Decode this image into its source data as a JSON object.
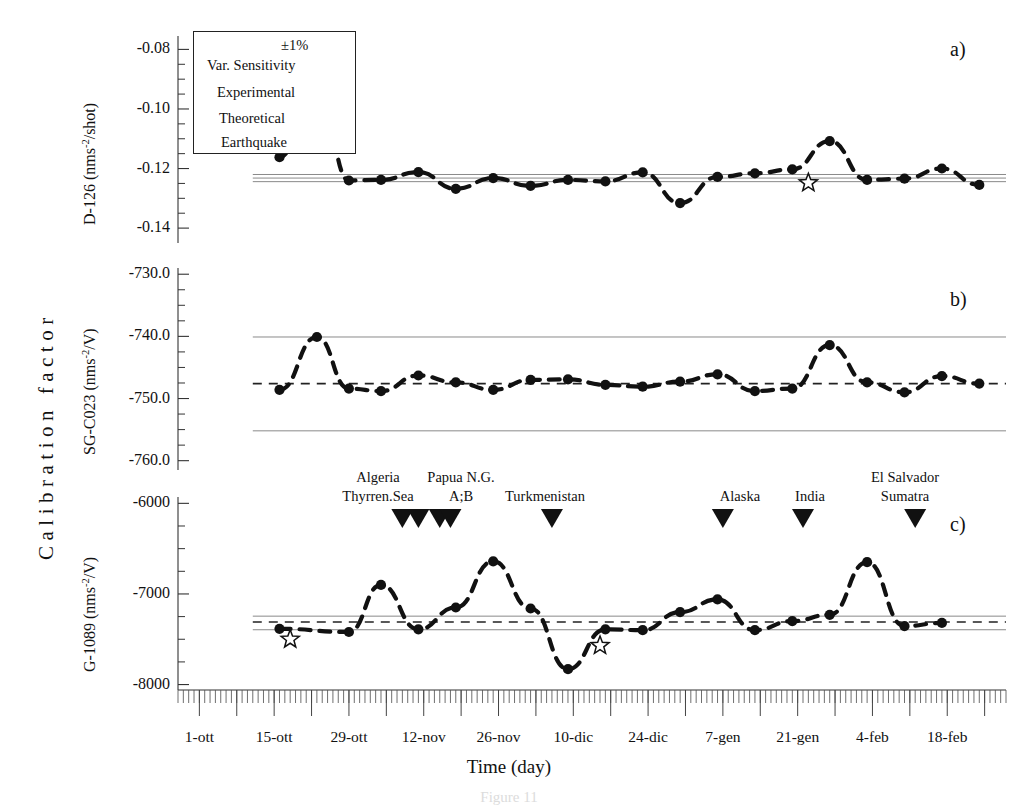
{
  "figure": {
    "caption": "Figure 11",
    "axis_y_group_label": "Calibration factor",
    "axis_x_label": "Time (day)"
  },
  "legend": {
    "dashed_label": "±1%",
    "sensitivity_label": "Var. Sensitivity",
    "experimental_label": "Experimental",
    "theoretical_label": "Theoretical",
    "earthquake_label": "Earthquake",
    "experimental_glyph": "star-open-icon",
    "theoretical_glyph": "filled-circle-icon",
    "earthquake_glyph": "down-triangle-icon"
  },
  "panels": [
    {
      "letter": "a)",
      "ylabel_text": "D-126 (nms",
      "ylabel_sup": "-2",
      "ylabel_tail": "/shot)",
      "yticks": [
        "-0.08",
        "-0.10",
        "-0.12",
        "-0.14"
      ],
      "ytick_values": [
        -0.08,
        -0.1,
        -0.12,
        -0.14
      ],
      "ylim": [
        -0.145,
        -0.0755
      ],
      "center_line": -0.1232,
      "band_upper": -0.122,
      "band_lower": -0.1244,
      "center_style": "solid"
    },
    {
      "letter": "b)",
      "ylabel_text": "SG-C023 (nms",
      "ylabel_sup": "-2",
      "ylabel_tail": "/V)",
      "yticks": [
        "-730.0",
        "-740.0",
        "-750.0",
        "-760.0"
      ],
      "ytick_values": [
        -730.0,
        -740.0,
        -750.0,
        -760.0
      ],
      "ylim": [
        -761.5,
        -729.0
      ],
      "center_line": -747.6,
      "band_upper": -740.1,
      "band_lower": -755.2,
      "center_style": "dashed"
    },
    {
      "letter": "c)",
      "ylabel_text": "G-1089 (nms",
      "ylabel_sup": "-2",
      "ylabel_tail": "/V)",
      "yticks": [
        "-6000",
        "-7000",
        "-8000"
      ],
      "ytick_values": [
        -6000,
        -7000,
        -8000
      ],
      "ylim": [
        -8060,
        -5930
      ],
      "center_line": -7310,
      "band_upper": -7245,
      "band_lower": -7395,
      "center_style": "dashed"
    }
  ],
  "xaxis": {
    "tick_labels": [
      "1-ott",
      "15-ott",
      "29-ott",
      "12-nov",
      "26-nov",
      "10-dic",
      "24-dic",
      "7-gen",
      "21-gen",
      "4-feb",
      "18-feb"
    ],
    "tick_days": [
      0,
      14,
      28,
      42,
      56,
      70,
      84,
      98,
      112,
      126,
      140
    ],
    "day_min": -4,
    "day_max": 151,
    "minor_tick_step_days": 1,
    "major_tick_step_days": 7
  },
  "earthquakes": [
    {
      "labels": [
        "Algeria",
        "Thyrren.Sea"
      ],
      "day": 38,
      "marker_day": 38
    },
    {
      "labels": [
        "",
        ""
      ],
      "day": 41,
      "marker_day": 41
    },
    {
      "labels": [
        "Papua N.G.",
        "A;B"
      ],
      "day": 45,
      "marker_day": 45
    },
    {
      "labels": [
        "",
        ""
      ],
      "day": 47,
      "marker_day": 47
    },
    {
      "labels": [
        "Turkmenistan",
        ""
      ],
      "day": 66,
      "marker_day": 66
    },
    {
      "labels": [
        "Alaska",
        ""
      ],
      "day": 98,
      "marker_day": 98
    },
    {
      "labels": [
        "India",
        ""
      ],
      "day": 113,
      "marker_day": 113
    },
    {
      "labels": [
        "El Salvador",
        "Sumatra"
      ],
      "day": 134,
      "marker_day": 134
    }
  ],
  "chart_data": {
    "type": "line",
    "title": "Figure 11",
    "xlabel": "Time (day)",
    "ylabel": "Calibration factor",
    "grid": false,
    "legend_position": "top-left",
    "series": [
      {
        "name": "D-126 Theoretical",
        "panel": "a",
        "marker": "filled-circle",
        "line": "dashed",
        "x": [
          15,
          22,
          28,
          34,
          41,
          48,
          55,
          62,
          69,
          76,
          83,
          90,
          97,
          104,
          111,
          118,
          125,
          132,
          139,
          146
        ],
        "y": [
          -0.1162,
          -0.0892,
          -0.124,
          -0.1238,
          -0.1212,
          -0.1268,
          -0.1232,
          -0.1258,
          -0.1238,
          -0.1243,
          -0.1213,
          -0.1316,
          -0.1228,
          -0.1216,
          -0.1203,
          -0.1108,
          -0.1238,
          -0.1234,
          -0.12,
          -0.1255
        ]
      },
      {
        "name": "D-126 Experimental",
        "panel": "a",
        "marker": "star-open",
        "line": "none",
        "x": [
          114
        ],
        "y": [
          -0.1248
        ]
      },
      {
        "name": "SG-C023 Theoretical",
        "panel": "b",
        "marker": "filled-circle",
        "line": "dashed",
        "x": [
          15,
          22,
          28,
          34,
          41,
          48,
          55,
          62,
          69,
          76,
          83,
          90,
          97,
          104,
          111,
          118,
          125,
          132,
          139,
          146
        ],
        "y": [
          -748.6,
          -740.1,
          -748.4,
          -748.8,
          -746.3,
          -747.4,
          -748.6,
          -747.0,
          -746.9,
          -747.8,
          -748.1,
          -747.3,
          -746.1,
          -748.8,
          -748.4,
          -741.4,
          -747.4,
          -749.0,
          -746.4,
          -747.6
        ]
      },
      {
        "name": "G-1089 Theoretical",
        "panel": "c",
        "marker": "filled-circle",
        "line": "dashed",
        "x": [
          15,
          28,
          34,
          41,
          48,
          55,
          62,
          69,
          76,
          83,
          90,
          97,
          104,
          111,
          118,
          125,
          132,
          139
        ],
        "y": [
          -7385,
          -7420,
          -6900,
          -7390,
          -7150,
          -6640,
          -7160,
          -7830,
          -7390,
          -7400,
          -7200,
          -7060,
          -7400,
          -7300,
          -7230,
          -6650,
          -7355,
          -7320
        ]
      },
      {
        "name": "G-1089 Experimental",
        "panel": "c",
        "marker": "star-open",
        "line": "none",
        "x": [
          17,
          75
        ],
        "y": [
          -7500,
          -7570
        ]
      }
    ]
  }
}
